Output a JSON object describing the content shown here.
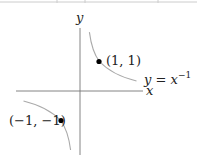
{
  "figure": {
    "function_label_lhs": "y",
    "function_label_eq": " = ",
    "function_label_base": "x",
    "function_label_exp": "−1",
    "axis_x_label": "x",
    "axis_y_label": "y",
    "points": [
      {
        "label": "(1, 1)",
        "x": 1,
        "y": 1
      },
      {
        "label": "(−1, −1)",
        "x": -1,
        "y": -1
      }
    ],
    "colors": {
      "axis": "#555555",
      "curve": "#999999",
      "point": "#000000",
      "top_rule": "#bbbbbb"
    }
  }
}
